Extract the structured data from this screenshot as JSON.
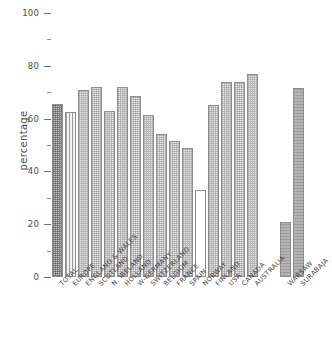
{
  "chart_data": {
    "type": "bar",
    "title": "",
    "xlabel": "",
    "ylabel": "percentage",
    "ylim": [
      0,
      100
    ],
    "yticks": [
      0,
      20,
      40,
      60,
      80,
      100
    ],
    "yticks_minor": [
      10,
      30,
      50,
      70,
      90
    ],
    "grid": false,
    "legend": "none",
    "categories": [
      "TOTAL",
      "EUROPE",
      "ENGLAND & WALES",
      "SCOTLAND",
      "N. IRELAND",
      "HOLLAND",
      "W-GERMANY",
      "SWITZERLAND",
      "BELGIUM",
      "FRANCE",
      "SPAIN",
      "NORWAY",
      "FINLAND",
      "USA",
      "CANADA",
      "AUSTRALIA",
      "WARSAW",
      "SURABAJA"
    ],
    "values": [
      65.5,
      62.5,
      71.0,
      72.0,
      63.0,
      72.0,
      68.5,
      61.5,
      54.0,
      51.5,
      49.0,
      33.0,
      65.0,
      74.0,
      74.0,
      77.0,
      21.0,
      71.5
    ],
    "bar_styles": [
      "fill-dark",
      "fill-vline",
      "fill-light",
      "fill-light",
      "fill-light",
      "fill-light",
      "fill-light",
      "fill-light",
      "fill-light",
      "fill-light",
      "fill-light",
      "fill-open",
      "fill-light",
      "fill-light",
      "fill-light",
      "fill-light",
      "fill-solid",
      "fill-solid"
    ],
    "groups": [
      {
        "name": "summary",
        "from": 0,
        "to": 1
      },
      {
        "name": "countries",
        "from": 2,
        "to": 15
      },
      {
        "name": "cities",
        "from": 16,
        "to": 17
      }
    ]
  },
  "axis": {
    "y_title": "percentage",
    "y_tick_labels": [
      "0",
      "20",
      "40",
      "60",
      "80",
      "100"
    ]
  }
}
